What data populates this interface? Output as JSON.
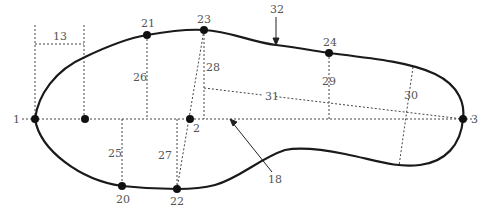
{
  "diagram": {
    "type": "shoe-last-outline-measurement-diagram",
    "colors": {
      "outline": "#1a1a1a",
      "dotted": "#444444",
      "label": "#555555",
      "point": "#111111"
    },
    "points": [
      {
        "id": "1",
        "label": "1",
        "x": 35,
        "y": 119,
        "label_x": 13,
        "label_y": 123
      },
      {
        "id": "unlabeled",
        "label": "",
        "x": 85,
        "y": 119
      },
      {
        "id": "2",
        "label": "2",
        "x": 190,
        "y": 119,
        "label_x": 193,
        "label_y": 132
      },
      {
        "id": "3",
        "label": "3",
        "x": 463,
        "y": 119,
        "label_x": 471,
        "label_y": 123
      },
      {
        "id": "20",
        "label": "20",
        "x": 122,
        "y": 186,
        "label_x": 116,
        "label_y": 203
      },
      {
        "id": "21",
        "label": "21",
        "x": 147,
        "y": 35,
        "label_x": 141,
        "label_y": 27
      },
      {
        "id": "22",
        "label": "22",
        "x": 177,
        "y": 189,
        "label_x": 170,
        "label_y": 205
      },
      {
        "id": "23",
        "label": "23",
        "x": 204,
        "y": 30,
        "label_x": 197,
        "label_y": 23
      },
      {
        "id": "24",
        "label": "24",
        "x": 329,
        "y": 53,
        "label_x": 323,
        "label_y": 46
      }
    ],
    "measurement_labels": [
      {
        "id": "13",
        "text": "13",
        "x": 53,
        "y": 40
      },
      {
        "id": "25",
        "text": "25",
        "x": 108,
        "y": 157
      },
      {
        "id": "26",
        "text": "26",
        "x": 133,
        "y": 81
      },
      {
        "id": "27",
        "text": "27",
        "x": 158,
        "y": 159
      },
      {
        "id": "28",
        "text": "28",
        "x": 206,
        "y": 71
      },
      {
        "id": "29",
        "text": "29",
        "x": 322,
        "y": 85
      },
      {
        "id": "30",
        "text": "30",
        "x": 404,
        "y": 99
      },
      {
        "id": "31",
        "text": "31",
        "x": 265,
        "y": 100
      },
      {
        "id": "18",
        "text": "18",
        "x": 268,
        "y": 183
      },
      {
        "id": "32",
        "text": "32",
        "x": 270,
        "y": 13
      }
    ]
  }
}
